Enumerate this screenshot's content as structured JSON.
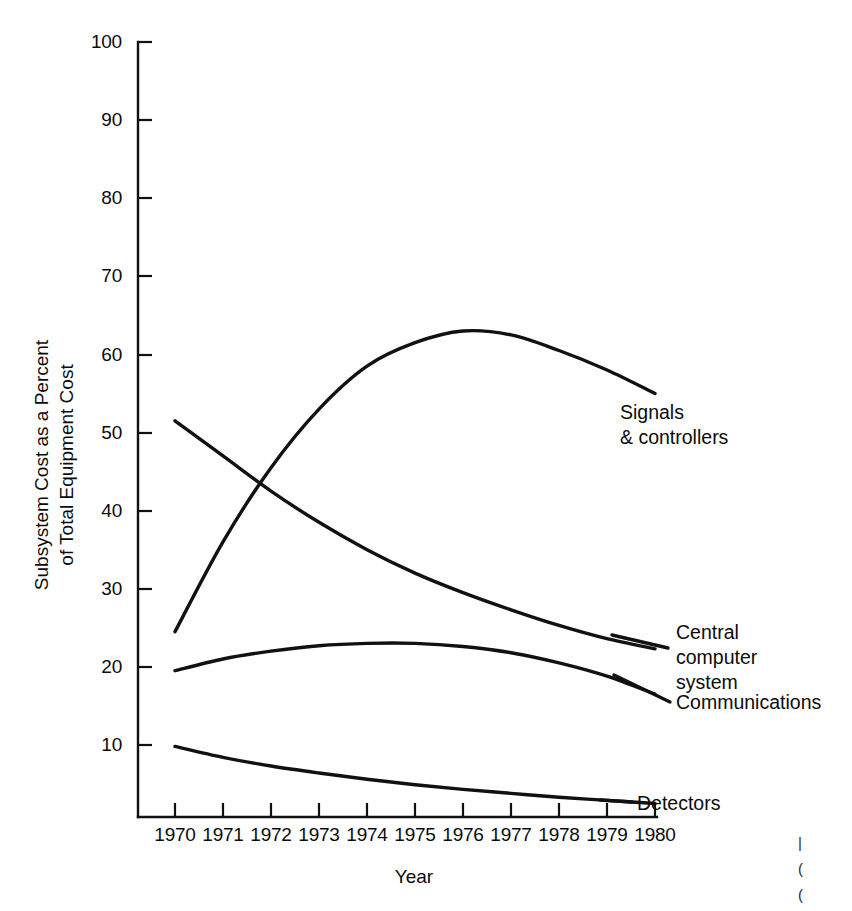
{
  "chart_data": {
    "type": "line",
    "title": "",
    "xlabel": "Year",
    "ylabel": "Subsystem Cost as a Percent of Total Equipment Cost",
    "ylabel_line1": "Subsystem Cost as a Percent",
    "ylabel_line2": "of Total Equipment Cost",
    "xlim": [
      1970,
      1980
    ],
    "ylim": [
      0,
      100
    ],
    "grid": false,
    "legend_position": "inline-right-annotations",
    "x": [
      1970,
      1971,
      1972,
      1973,
      1974,
      1975,
      1976,
      1977,
      1978,
      1979,
      1980
    ],
    "xtick_labels": [
      "1970",
      "1971",
      "1972",
      "1973",
      "1974",
      "1975",
      "1976",
      "1977",
      "1978",
      "1979",
      "1980"
    ],
    "ytick_values": [
      10,
      20,
      30,
      40,
      50,
      60,
      70,
      80,
      90,
      100
    ],
    "ytick_labels": [
      "10",
      "20",
      "30",
      "40",
      "50",
      "60",
      "70",
      "80",
      "90",
      "100"
    ],
    "series": [
      {
        "name": "Signals & controllers",
        "label_line1": "Signals",
        "label_line2": "& controllers",
        "values": [
          24.5,
          36.0,
          45.5,
          53.0,
          58.5,
          61.5,
          63.0,
          62.5,
          60.5,
          58.0,
          55.0
        ]
      },
      {
        "name": "Central computer system",
        "label_line1": "Central",
        "label_line2": "computer",
        "label_line3": "system",
        "values": [
          51.5,
          47.0,
          42.5,
          38.5,
          35.0,
          32.0,
          29.5,
          27.3,
          25.3,
          23.6,
          22.3
        ]
      },
      {
        "name": "Communications",
        "label_line1": "Communications",
        "values": [
          19.5,
          21.0,
          22.0,
          22.7,
          23.0,
          23.0,
          22.6,
          21.8,
          20.5,
          18.8,
          16.5
        ]
      },
      {
        "name": "Detectors",
        "label_line1": "Detectors",
        "values": [
          9.8,
          8.4,
          7.3,
          6.4,
          5.6,
          4.9,
          4.3,
          3.8,
          3.3,
          2.9,
          2.5
        ]
      }
    ]
  },
  "axis": {
    "y_title_line1": "Subsystem Cost as a Percent",
    "y_title_line2": "of Total Equipment Cost",
    "x_title": "Year"
  },
  "annotations": {
    "signals_line1": "Signals",
    "signals_line2": "& controllers",
    "central_line1": "Central",
    "central_line2": "computer",
    "central_line3": "system",
    "communications": "Communications",
    "detectors": "Detectors"
  },
  "ticks": {
    "y": [
      "100",
      "90",
      "80",
      "70",
      "60",
      "50",
      "40",
      "30",
      "20",
      "10"
    ],
    "x": [
      "1970",
      "1971",
      "1972",
      "1973",
      "1974",
      "1975",
      "1976",
      "1977",
      "1978",
      "1979",
      "1980"
    ]
  },
  "colors": {
    "ink": "#111111",
    "background": "#ffffff"
  }
}
